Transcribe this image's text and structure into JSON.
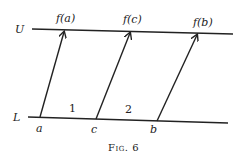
{
  "diagram": {
    "upper_line_label": "U",
    "lower_line_label": "L",
    "upper_points": [
      "f(a)",
      "f(c)",
      "f(b)"
    ],
    "lower_points": [
      "a",
      "c",
      "b"
    ],
    "interval_labels": [
      "1",
      "2"
    ],
    "caption": "Fig. 6",
    "colors": {
      "ink": "#222222",
      "background": "#ffffff"
    }
  }
}
